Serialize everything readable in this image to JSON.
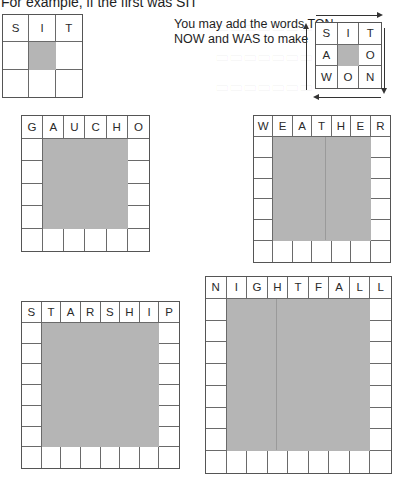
{
  "intro": {
    "text": "For example, if the first was SIT"
  },
  "instruction": {
    "line1": "You may add the words TON",
    "line2": "NOW and WAS to make"
  },
  "example_small": {
    "word": "SIT",
    "size": 3,
    "top_letters": [
      "S",
      "I",
      "T"
    ]
  },
  "example_solved": {
    "size": 3,
    "rows": [
      [
        "S",
        "I",
        "T"
      ],
      [
        "A",
        "",
        "O"
      ],
      [
        "W",
        "O",
        "N"
      ]
    ],
    "arrows": [
      "right",
      "down",
      "left",
      "up"
    ]
  },
  "puzzles": [
    {
      "id": "gaucho",
      "word": "GAUCHO",
      "size": 6,
      "letters": [
        "G",
        "A",
        "U",
        "C",
        "H",
        "O"
      ]
    },
    {
      "id": "weather",
      "word": "WEATHER",
      "size": 7,
      "letters": [
        "W",
        "E",
        "A",
        "T",
        "H",
        "E",
        "R"
      ]
    },
    {
      "id": "starship",
      "word": "STARSHIP",
      "size": 8,
      "letters": [
        "S",
        "T",
        "A",
        "R",
        "S",
        "H",
        "I",
        "P"
      ]
    },
    {
      "id": "nightfall",
      "word": "NIGHTFALL",
      "size": 9,
      "letters": [
        "N",
        "I",
        "G",
        "H",
        "T",
        "F",
        "A",
        "L",
        "L"
      ]
    }
  ],
  "colors": {
    "shade": "#b5b5b5",
    "grid_line": "#6a6a6a",
    "text": "#1e1e1e"
  }
}
